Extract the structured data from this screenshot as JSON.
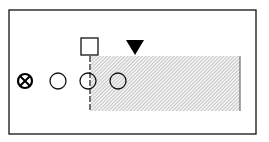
{
  "diagram": {
    "frame": {
      "x": 9,
      "y": 10,
      "w": 247,
      "h": 124,
      "stroke": "#111111"
    },
    "shaded_region": {
      "x": 91,
      "y": 56,
      "w": 149,
      "h": 55,
      "pattern": "diagonal-hatch",
      "color": "#999999"
    },
    "dashed_line": {
      "x": 90,
      "y1": 56,
      "y2": 112
    },
    "square_marker": {
      "x": 81,
      "y": 38,
      "size": 17
    },
    "triangle_marker": {
      "cx": 135,
      "top": 40,
      "bottom": 55,
      "half_width": 9,
      "fill": "#000000"
    },
    "circles": [
      {
        "cx": 25,
        "cy": 81,
        "r": 7.5,
        "type": "crossed"
      },
      {
        "cx": 58,
        "cy": 81,
        "r": 8,
        "type": "open"
      },
      {
        "cx": 88,
        "cy": 81,
        "r": 8,
        "type": "open"
      },
      {
        "cx": 118,
        "cy": 81,
        "r": 8,
        "type": "open"
      }
    ]
  }
}
